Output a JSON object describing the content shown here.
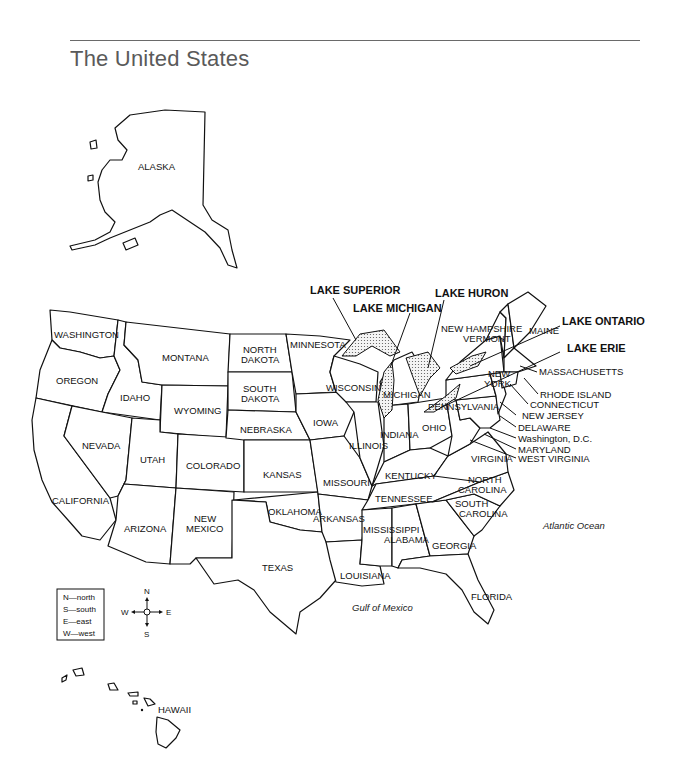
{
  "title": "The United States",
  "states": {
    "alaska": "ALASKA",
    "hawaii": "HAWAII",
    "washington": "WASHINGTON",
    "oregon": "OREGON",
    "california": "CALIFORNIA",
    "idaho": "IDAHO",
    "nevada": "NEVADA",
    "montana": "MONTANA",
    "wyoming": "WYOMING",
    "utah": "UTAH",
    "arizona": "ARIZONA",
    "colorado": "COLORADO",
    "new_mexico_1": "NEW",
    "new_mexico_2": "MEXICO",
    "north_dakota_1": "NORTH",
    "north_dakota_2": "DAKOTA",
    "south_dakota_1": "SOUTH",
    "south_dakota_2": "DAKOTA",
    "nebraska": "NEBRASKA",
    "kansas": "KANSAS",
    "oklahoma": "OKLAHOMA",
    "texas": "TEXAS",
    "minnesota": "MINNESOTA",
    "iowa": "IOWA",
    "missouri": "MISSOURI",
    "arkansas": "ARKANSAS",
    "louisiana": "LOUISIANA",
    "wisconsin": "WISCONSIN",
    "illinois": "ILLINOIS",
    "michigan": "MICHIGAN",
    "indiana": "INDIANA",
    "ohio": "OHIO",
    "kentucky": "KENTUCKY",
    "tennessee": "TENNESSEE",
    "mississippi": "MISSISSIPPI",
    "alabama": "ALABAMA",
    "georgia": "GEORGIA",
    "florida": "FLORIDA",
    "south_carolina_1": "SOUTH",
    "south_carolina_2": "CAROLINA",
    "north_carolina_1": "NORTH",
    "north_carolina_2": "CAROLINA",
    "virginia": "VIRGINIA",
    "west_virginia": "WEST VIRGINIA",
    "maryland": "MARYLAND",
    "washington_dc": "Washington, D.C.",
    "delaware": "DELAWARE",
    "new_jersey": "NEW JERSEY",
    "pennsylvania": "PENNSYLVANIA",
    "new_york_1": "NEW",
    "new_york_2": "YORK",
    "connecticut": "CONNECTICUT",
    "rhode_island": "RHODE ISLAND",
    "massachusetts": "MASSACHUSETTS",
    "vermont": "VERMONT",
    "new_hampshire": "NEW HAMPSHIRE",
    "maine": "MAINE"
  },
  "lakes": {
    "superior": "LAKE SUPERIOR",
    "michigan": "LAKE MICHIGAN",
    "huron": "LAKE HURON",
    "ontario": "LAKE ONTARIO",
    "erie": "LAKE ERIE"
  },
  "water": {
    "atlantic": "Atlantic Ocean",
    "gulf": "Gulf of Mexico"
  },
  "legend": {
    "items": [
      "N—north",
      "S—south",
      "E—east",
      "W—west"
    ]
  },
  "compass": {
    "n": "N",
    "s": "S",
    "e": "E",
    "w": "W"
  }
}
